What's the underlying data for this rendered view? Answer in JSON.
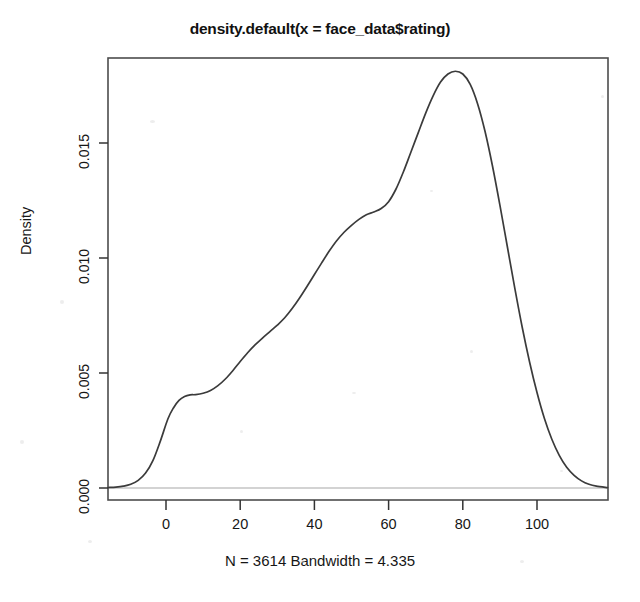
{
  "chart_data": {
    "type": "line",
    "title": "density.default(x = face_data$rating)",
    "subtitle": "N = 3614  Bandwidth = 4.335",
    "xlabel": "",
    "ylabel": "Density",
    "xlim": [
      -15.6,
      119.0
    ],
    "ylim": [
      -0.0005,
      0.01925
    ],
    "xticks": [
      0,
      20,
      40,
      60,
      80,
      100
    ],
    "xtick_labels": [
      "0",
      "20",
      "40",
      "60",
      "80",
      "100"
    ],
    "yticks": [
      0.0,
      0.005,
      0.01,
      0.015
    ],
    "ytick_labels": [
      "0.000",
      "0.005",
      "0.010",
      "0.015"
    ],
    "grid": false,
    "legend": null,
    "baseline_y": 0.0,
    "n": 3614,
    "bandwidth": 4.335,
    "peak": {
      "x": 78.0,
      "y": 0.0181
    },
    "series": [
      {
        "name": "density",
        "color": "#3b3b3b",
        "x": [
          -15.6,
          -13.5,
          -11.5,
          -9.5,
          -7.5,
          -5.5,
          -3.5,
          -1.5,
          0.5,
          2.0,
          3.5,
          5.0,
          6.5,
          8.0,
          10.0,
          12.0,
          14.0,
          16.0,
          18.0,
          20.0,
          22.0,
          24.0,
          26.0,
          28.0,
          30.0,
          32.0,
          34.0,
          36.0,
          38.0,
          40.0,
          42.0,
          44.0,
          46.0,
          48.0,
          50.0,
          52.0,
          54.0,
          56.0,
          58.0,
          60.0,
          62.0,
          64.0,
          66.0,
          68.0,
          70.0,
          72.0,
          74.0,
          76.0,
          78.0,
          80.0,
          82.0,
          84.0,
          86.0,
          88.0,
          90.0,
          92.0,
          94.0,
          96.0,
          98.0,
          100.0,
          102.0,
          104.0,
          106.0,
          108.0,
          110.0,
          112.0,
          114.0,
          116.0,
          119.0
        ],
        "y": [
          2e-05,
          4e-05,
          8e-05,
          0.00016,
          0.00033,
          0.00065,
          0.0012,
          0.00205,
          0.003,
          0.00348,
          0.00381,
          0.00398,
          0.00405,
          0.00406,
          0.00412,
          0.00424,
          0.00445,
          0.00474,
          0.0051,
          0.0055,
          0.00588,
          0.00622,
          0.00652,
          0.0068,
          0.00708,
          0.0074,
          0.0078,
          0.00826,
          0.00876,
          0.00928,
          0.0098,
          0.0103,
          0.01075,
          0.01112,
          0.01142,
          0.01168,
          0.01188,
          0.012,
          0.01215,
          0.01245,
          0.013,
          0.01375,
          0.0146,
          0.01545,
          0.0163,
          0.01705,
          0.01765,
          0.018,
          0.01812,
          0.018,
          0.01755,
          0.0167,
          0.0155,
          0.014,
          0.0123,
          0.0105,
          0.0087,
          0.007,
          0.00548,
          0.00415,
          0.00302,
          0.00212,
          0.00142,
          0.0009,
          0.00055,
          0.00031,
          0.00016,
          8e-05,
          2e-05
        ]
      }
    ]
  },
  "axes": {
    "y_axis_label": "Density",
    "tick_color": "#333333",
    "box_color": "#4d4d4d",
    "baseline_color": "#c4c4c4",
    "curve_color": "#3b3b3b"
  }
}
